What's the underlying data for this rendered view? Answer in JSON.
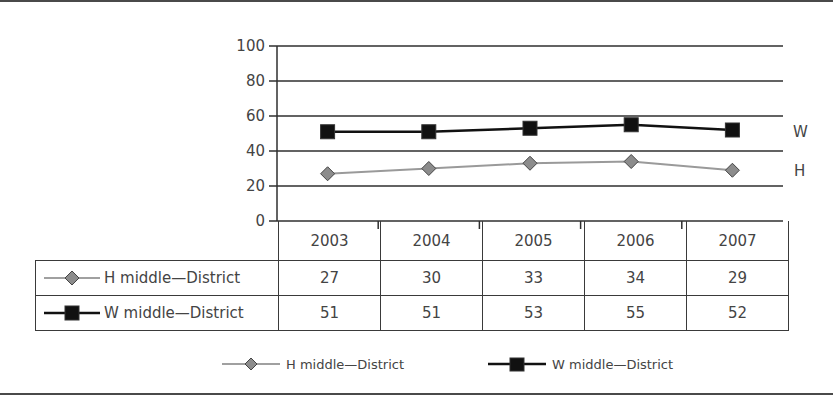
{
  "chart_data": {
    "type": "line",
    "title": "",
    "xlabel": "",
    "ylabel": "",
    "ylim": [
      0,
      100
    ],
    "yticks": [
      0,
      20,
      40,
      60,
      80,
      100
    ],
    "grid": true,
    "legend_position": "bottom",
    "categories": [
      "2003",
      "2004",
      "2005",
      "2006",
      "2007"
    ],
    "series": [
      {
        "name": "H middle—District",
        "end_label": "H",
        "marker": "diamond",
        "color": "#8c8c8c",
        "line_color": "#9a9a9a",
        "values": [
          27,
          30,
          33,
          34,
          29
        ]
      },
      {
        "name": "W middle—District",
        "end_label": "W",
        "marker": "square",
        "color": "#111111",
        "line_color": "#111111",
        "values": [
          51,
          51,
          53,
          55,
          52
        ]
      }
    ],
    "data_table": true
  },
  "axis": {
    "yticks": [
      "0",
      "20",
      "40",
      "60",
      "80",
      "100"
    ]
  },
  "table": {
    "years": [
      "2003",
      "2004",
      "2005",
      "2006",
      "2007"
    ],
    "rows": [
      {
        "label": "H middle—District",
        "values": [
          "27",
          "30",
          "33",
          "34",
          "29"
        ]
      },
      {
        "label": "W middle—District",
        "values": [
          "51",
          "51",
          "53",
          "55",
          "52"
        ]
      }
    ]
  },
  "end_labels": {
    "h": "H",
    "w": "W"
  },
  "legend": {
    "items": [
      {
        "label": "H middle—District"
      },
      {
        "label": "W middle—District"
      }
    ]
  }
}
